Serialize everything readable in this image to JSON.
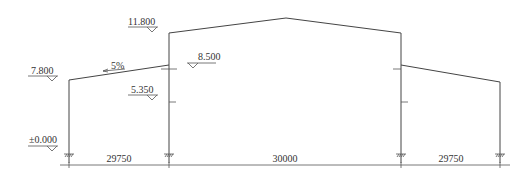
{
  "diagram": {
    "type": "portal-frame-elevation",
    "colors": {
      "line": "#444444",
      "text": "#333333",
      "background": "#ffffff"
    },
    "elevations": [
      {
        "label": "11.800",
        "x": 146,
        "y": 22
      },
      {
        "label": "8.500",
        "x": 196,
        "y": 62
      },
      {
        "label": "7.800",
        "x": 30,
        "y": 73
      },
      {
        "label": "5.350",
        "x": 146,
        "y": 93
      },
      {
        "label": "±0.000",
        "x": 30,
        "y": 143
      }
    ],
    "slope": {
      "label": "5%"
    },
    "spans": [
      {
        "label": "29750"
      },
      {
        "label": "30000"
      },
      {
        "label": "29750"
      }
    ]
  }
}
